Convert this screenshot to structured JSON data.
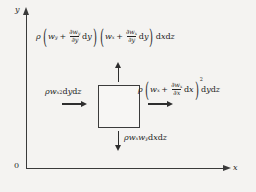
{
  "figure": {
    "background_color": "#f4f3f1",
    "line_color": "#3a3a3a",
    "axes": {
      "y_label": "y",
      "x_label": "x",
      "origin_label": "0"
    },
    "control_volume": {
      "name": "fluid element",
      "border_color": "#3b3b3b",
      "fill_color": "#f7f6f4"
    },
    "arrows": [
      {
        "name": "top-flux-arrow",
        "direction": "up"
      },
      {
        "name": "bottom-flux-arrow",
        "direction": "down"
      },
      {
        "name": "left-flux-arrow",
        "direction": "right"
      },
      {
        "name": "right-flux-arrow",
        "direction": "right"
      }
    ],
    "labels": {
      "top_flux": {
        "plain": "ρ ( w_y + ∂w_y/∂y dy ) ( w_x + ∂w_x/∂y dy ) dx dz",
        "rho": "ρ",
        "group1": {
          "term": "w",
          "sub": "y",
          "op": "+",
          "num_d": "∂w",
          "num_sub": "y",
          "den_d": "∂y",
          "diff": "d",
          "diff_var": "y"
        },
        "group2": {
          "term": "w",
          "sub": "x",
          "op": "+",
          "num_d": "∂w",
          "num_sub": "x",
          "den_d": "∂y",
          "diff": "d",
          "diff_var": "y"
        },
        "tail": {
          "d1": "d",
          "v1": "x",
          "d2": "d",
          "v2": "z"
        }
      },
      "left_flux": {
        "plain": "ρ w_x² dy dz",
        "rho": "ρ",
        "term": "w",
        "sub": "x",
        "exp": "2",
        "tail": {
          "d1": "d",
          "v1": "y",
          "d2": "d",
          "v2": "z"
        }
      },
      "right_flux": {
        "plain": "ρ ( w_x + ∂w_x/∂x dx )² dy dz",
        "rho": "ρ",
        "group": {
          "term": "w",
          "sub": "x",
          "op": "+",
          "num_d": "∂w",
          "num_sub": "x",
          "den_d": "∂x",
          "diff": "d",
          "diff_var": "x"
        },
        "exp": "2",
        "tail": {
          "d1": "d",
          "v1": "y",
          "d2": "d",
          "v2": "z"
        }
      },
      "bottom_flux": {
        "plain": "ρ w_x w_y dx dz",
        "rho": "ρ",
        "term1": "w",
        "sub1": "x",
        "term2": "w",
        "sub2": "y",
        "tail": {
          "d1": "d",
          "v1": "x",
          "d2": "d",
          "v2": "z"
        }
      }
    }
  }
}
